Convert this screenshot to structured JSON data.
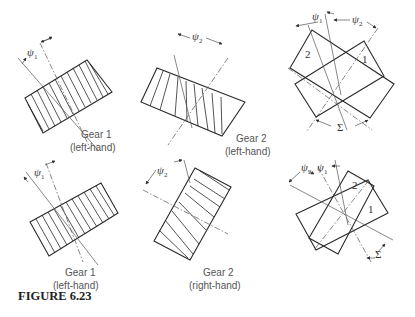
{
  "figure": {
    "caption": "FIGURE 6.23",
    "panels": [
      {
        "id": "top-gear1",
        "gear": "Gear 1",
        "hand": "(left-hand)",
        "angle_symbol": "ψ",
        "angle_sub": "1"
      },
      {
        "id": "top-gear2",
        "gear": "Gear 2",
        "hand": "(left-hand)",
        "angle_symbol": "ψ",
        "angle_sub": "2"
      },
      {
        "id": "top-mesh",
        "labels": [
          "2",
          "1"
        ],
        "angle1_symbol": "ψ",
        "angle1_sub": "1",
        "angle2_symbol": "ψ",
        "angle2_sub": "2",
        "shaft_angle_symbol": "Σ"
      },
      {
        "id": "bottom-gear1",
        "gear": "Gear 1",
        "hand": "(left-hand)",
        "angle_symbol": "ψ",
        "angle_sub": "1"
      },
      {
        "id": "bottom-gear2",
        "gear": "Gear 2",
        "hand": "(right-hand)",
        "angle_symbol": "ψ",
        "angle_sub": "2"
      },
      {
        "id": "bottom-mesh",
        "labels": [
          "2",
          "1"
        ],
        "angle1_symbol": "ψ",
        "angle1_sub": "1",
        "angle2_symbol": "ψ",
        "angle2_sub": "2",
        "shaft_angle_symbol": "Σ"
      }
    ]
  }
}
